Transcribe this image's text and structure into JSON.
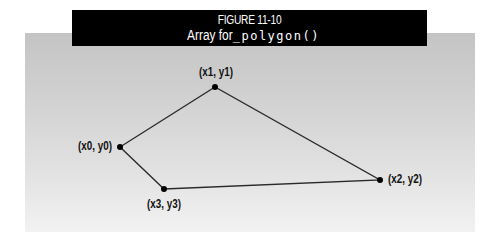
{
  "figure": {
    "number_label": "FIGURE 11-10",
    "caption_text": "Array for ",
    "caption_code": "_polygon()"
  },
  "diagram": {
    "shape": "quadrilateral",
    "line_color": "#2a2a2a",
    "point_color": "#000000",
    "vertices": [
      {
        "label": "(x0, y0)",
        "x": 120,
        "y": 147
      },
      {
        "label": "(x1, y1)",
        "x": 215,
        "y": 87
      },
      {
        "label": "(x2, y2)",
        "x": 380,
        "y": 180
      },
      {
        "label": "(x3, y3)",
        "x": 164,
        "y": 189
      }
    ]
  }
}
